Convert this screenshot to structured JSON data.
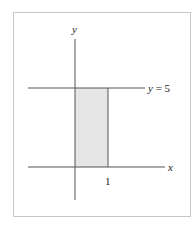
{
  "figure": {
    "y_axis_label": "y",
    "x_axis_label": "x",
    "line_label": "y = 5",
    "tick_label": "1",
    "colors": {
      "frame": "#c8c8c8",
      "axis": "#555555",
      "fill": "#e6e6e6"
    }
  },
  "chart_data": {
    "type": "area",
    "title": "",
    "xlabel": "x",
    "ylabel": "y",
    "shaded_region": {
      "x": [
        0,
        1
      ],
      "y": [
        0,
        5
      ]
    },
    "lines": [
      {
        "name": "y = 5",
        "y": 5
      }
    ],
    "x_ticks": [
      {
        "value": 1,
        "label": "1"
      }
    ],
    "grid": false
  }
}
